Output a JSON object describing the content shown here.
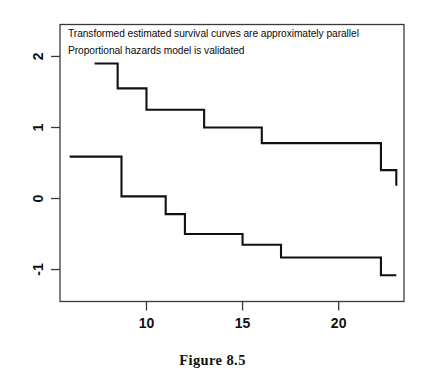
{
  "figure": {
    "caption": "Figure 8.5"
  },
  "chart_data": {
    "type": "line",
    "title": "",
    "subtitle": "",
    "xlabel": "",
    "ylabel": "",
    "xlim": [
      5.5,
      23.4
    ],
    "ylim": [
      -1.45,
      2.45
    ],
    "grid": false,
    "legend_position": "none",
    "x_ticks": [
      10,
      15,
      20
    ],
    "x_tick_labels": [
      "10",
      "15",
      "20"
    ],
    "y_ticks": [
      -1,
      0,
      1,
      2
    ],
    "y_tick_labels": [
      "-1",
      "0",
      "1",
      "2"
    ],
    "annotations": [
      "Transformed estimated survival curves are approximately parallel",
      "Proportional hazards model is validated"
    ],
    "series": [
      {
        "name": "upper-curve",
        "style": "step-post",
        "x": [
          7.3,
          8.5,
          10.0,
          13.0,
          16.0,
          22.2,
          23.0
        ],
        "values": [
          1.9,
          1.55,
          1.25,
          1.0,
          0.78,
          0.4,
          0.18
        ]
      },
      {
        "name": "lower-curve",
        "style": "step-post",
        "x": [
          6.0,
          8.7,
          11.0,
          12.0,
          15.0,
          17.0,
          22.2,
          23.0
        ],
        "values": [
          0.59,
          0.03,
          -0.22,
          -0.5,
          -0.65,
          -0.83,
          -1.08,
          -1.08
        ]
      }
    ],
    "colors": {
      "curve": "#111111",
      "axis": "#3a3a3a",
      "background": "#ffffff"
    }
  }
}
